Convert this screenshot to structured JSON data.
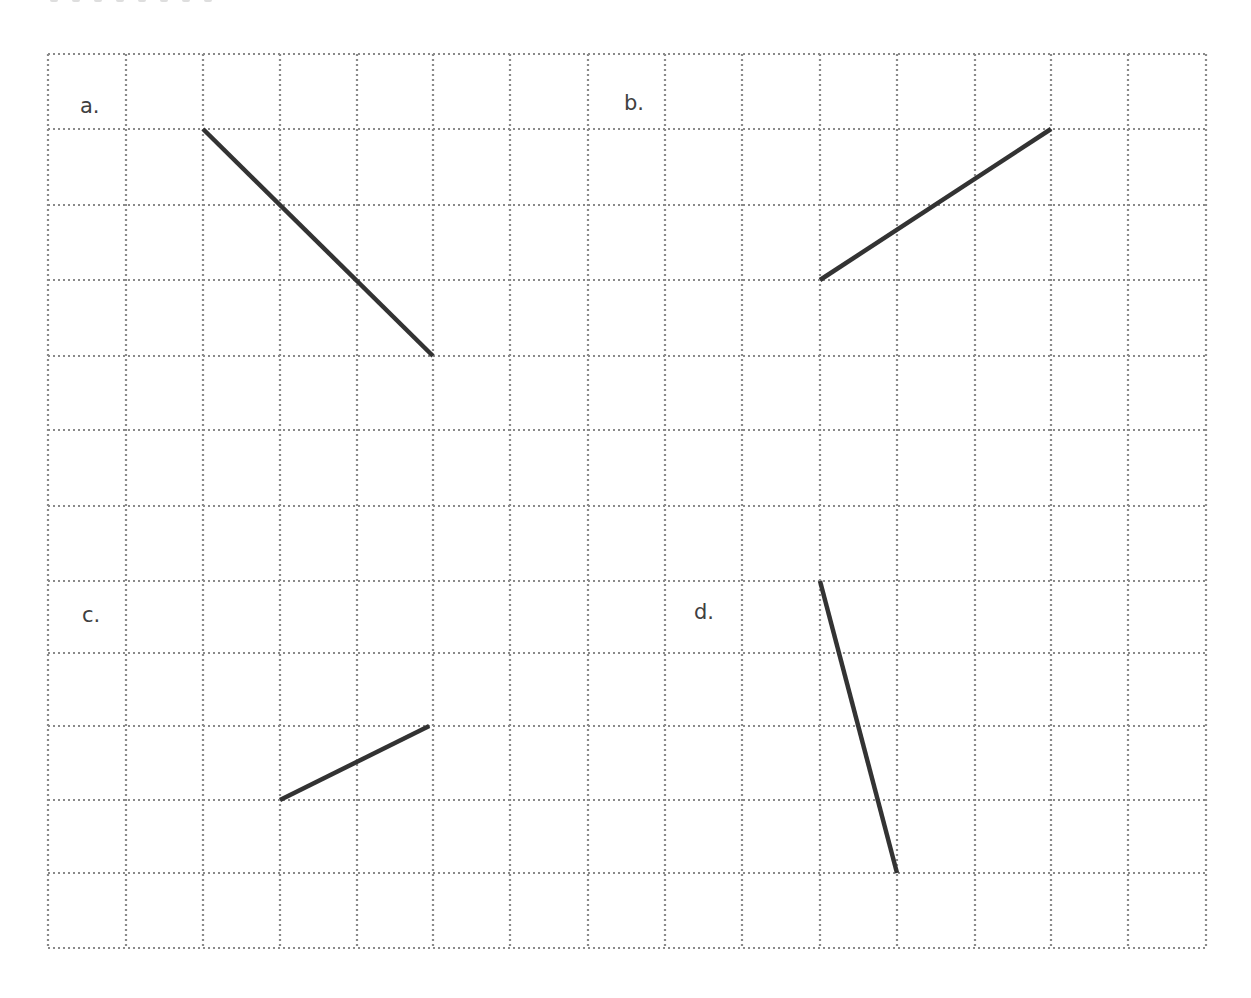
{
  "worksheet": {
    "grid": {
      "columns": 15,
      "rows": 12,
      "x_lines": [
        48,
        126,
        203,
        280,
        357,
        433,
        510,
        588,
        665,
        742,
        820,
        897,
        975,
        1051,
        1128,
        1206
      ],
      "y_lines": [
        54,
        129,
        205,
        280,
        356,
        430,
        506,
        581,
        653,
        726,
        800,
        873,
        948
      ],
      "line_color": "#8a8a8a",
      "dot_pattern": "2 3"
    },
    "segment_color": "#333333",
    "panels": [
      {
        "label": "a.",
        "label_pos": {
          "x": 80,
          "y": 96
        },
        "segment": {
          "from": {
            "col": 2,
            "row": 1
          },
          "to": {
            "col": 5,
            "row": 4
          }
        }
      },
      {
        "label": "b.",
        "label_pos": {
          "x": 624,
          "y": 93
        },
        "segment": {
          "from": {
            "col": 10,
            "row": 3
          },
          "to": {
            "col": 13,
            "row": 1
          }
        }
      },
      {
        "label": "c.",
        "label_pos": {
          "x": 82,
          "y": 605
        },
        "segment": {
          "from": {
            "col": 3,
            "row": 10
          },
          "to": {
            "col": 4.95,
            "row": 9
          }
        }
      },
      {
        "label": "d.",
        "label_pos": {
          "x": 694,
          "y": 602
        },
        "segment": {
          "from": {
            "col": 10,
            "row": 7
          },
          "to": {
            "col": 11,
            "row": 11
          }
        }
      }
    ]
  }
}
